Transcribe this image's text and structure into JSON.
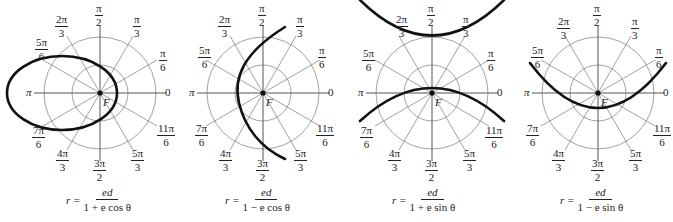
{
  "figure": {
    "focus_label": "F",
    "angle_labels": {
      "a0": "0",
      "pi": "π",
      "pi6": {
        "num": "π",
        "den": "6"
      },
      "pi3": {
        "num": "π",
        "den": "3"
      },
      "pi2": {
        "num": "π",
        "den": "2"
      },
      "2pi3": {
        "num": "2π",
        "den": "3"
      },
      "5pi6": {
        "num": "5π",
        "den": "6"
      },
      "7pi6": {
        "num": "7π",
        "den": "6"
      },
      "4pi3": {
        "num": "4π",
        "den": "3"
      },
      "3pi2": {
        "num": "3π",
        "den": "2"
      },
      "5pi3": {
        "num": "5π",
        "den": "3"
      },
      "11pi6": {
        "num": "11π",
        "den": "6"
      }
    },
    "panels": [
      {
        "id": "p1",
        "conic": "ellipse",
        "equation": {
          "lhs": "r =",
          "num": "ed",
          "den": "1 + e cos θ"
        }
      },
      {
        "id": "p2",
        "conic": "parabola",
        "equation": {
          "lhs": "r =",
          "num": "ed",
          "den": "1 − e cos θ"
        }
      },
      {
        "id": "p3",
        "conic": "hyperbola",
        "equation": {
          "lhs": "r =",
          "num": "ed",
          "den": "1 + e sin θ"
        }
      },
      {
        "id": "p4",
        "conic": "parabola",
        "equation": {
          "lhs": "r =",
          "num": "ed",
          "den": "1 − e sin θ"
        }
      }
    ]
  }
}
